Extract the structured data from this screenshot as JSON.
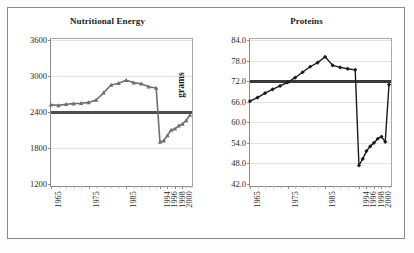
{
  "figure": {
    "background": "#ffffff",
    "frame_color": "#8b8b8b"
  },
  "chart_data": [
    {
      "type": "line",
      "title": "Nutritional Energy",
      "xlabel": "",
      "ylabel": "Kcal",
      "ylim": [
        1200,
        3600
      ],
      "yticks": [
        "1200",
        "1800",
        "2400",
        "3000",
        "3600"
      ],
      "ytick_values": [
        1200,
        1800,
        2400,
        3000,
        3600
      ],
      "xticks": [
        "1965",
        "1975",
        "1985",
        "1994",
        "1996",
        "1998",
        "2000"
      ],
      "xtick_values": [
        1965,
        1975,
        1985,
        1994,
        1996,
        1998,
        2000
      ],
      "grid": true,
      "legend": "none",
      "series": [
        {
          "name": "Kcal per capita",
          "color": "#6e6e6e",
          "marker": "triangle",
          "x": [
            1965,
            1967,
            1969,
            1971,
            1973,
            1975,
            1977,
            1979,
            1981,
            1983,
            1985,
            1987,
            1989,
            1991,
            1993,
            1994,
            1995,
            1996,
            1997,
            1998,
            1999,
            2000,
            2001,
            2002
          ],
          "values": [
            2520,
            2510,
            2530,
            2540,
            2545,
            2560,
            2600,
            2720,
            2850,
            2880,
            2930,
            2890,
            2870,
            2820,
            2800,
            1900,
            1920,
            2010,
            2100,
            2120,
            2170,
            2200,
            2260,
            2350
          ]
        }
      ],
      "reference_line": {
        "name": "minimum requirement",
        "value": 2400,
        "color": "#4d4d4d"
      }
    },
    {
      "type": "line",
      "title": "Proteins",
      "xlabel": "",
      "ylabel": "grams",
      "ylim": [
        42.0,
        84.0
      ],
      "yticks": [
        "42.0",
        "48.0",
        "54.0",
        "60.0",
        "66.0",
        "72.0",
        "78.0",
        "84.0"
      ],
      "ytick_values": [
        42.0,
        48.0,
        54.0,
        60.0,
        66.0,
        72.0,
        78.0,
        84.0
      ],
      "xticks": [
        "1965",
        "1975",
        "1985",
        "1994",
        "1996",
        "1998",
        "2000"
      ],
      "xtick_values": [
        1965,
        1975,
        1985,
        1994,
        1996,
        1998,
        2000
      ],
      "grid": true,
      "legend": "none",
      "series": [
        {
          "name": "Protein per capita",
          "color": "#1a1a1a",
          "marker": "diamond",
          "x": [
            1965,
            1967,
            1969,
            1971,
            1973,
            1975,
            1977,
            1979,
            1981,
            1983,
            1985,
            1987,
            1989,
            1991,
            1993,
            1994,
            1995,
            1996,
            1997,
            1998,
            1999,
            2000,
            2001,
            2002
          ],
          "values": [
            66.2,
            67.2,
            68.5,
            69.6,
            70.6,
            71.6,
            73.0,
            74.6,
            76.2,
            77.4,
            79.1,
            76.6,
            76.0,
            75.6,
            75.3,
            47.4,
            49.3,
            51.6,
            53.0,
            54.0,
            55.2,
            55.8,
            54.3,
            71.0
          ]
        }
      ],
      "reference_line": {
        "name": "minimum requirement",
        "value": 72.0,
        "color": "#3a3a3a"
      }
    }
  ]
}
